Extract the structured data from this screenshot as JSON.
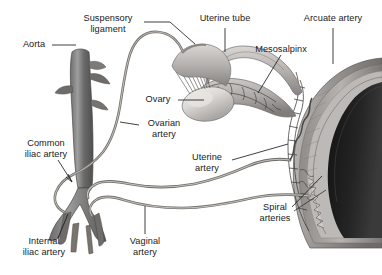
{
  "figure": {
    "style": "grayscale medical illustration",
    "colors": {
      "background": "#ffffff",
      "label_text": "#1a1a1a",
      "leader_line": "#2a2a2a",
      "vessel_dark": "#5e5e5e",
      "vessel_mid": "#8a8a8a",
      "vessel_light": "#b9b9b9",
      "ovary_pale": "#d8d5d2",
      "tissue_mid": "#a8a5a2",
      "cavity_dark": "#1c1c1c",
      "uterus_wall": "#9a9794"
    }
  },
  "labels": [
    {
      "id": "suspensory-ligament",
      "text": "Suspensory\nligament",
      "x": 108,
      "y": 17,
      "align": "center"
    },
    {
      "id": "uterine-tube",
      "text": "Uterine tube",
      "x": 225,
      "y": 17,
      "align": "center"
    },
    {
      "id": "arcuate-artery",
      "text": "Arcuate artery",
      "x": 333,
      "y": 17,
      "align": "center"
    },
    {
      "id": "aorta",
      "text": "Aorta",
      "x": 34,
      "y": 41,
      "align": "center"
    },
    {
      "id": "mesosalpinx",
      "text": "Mesosalpinx",
      "x": 285,
      "y": 48,
      "align": "center"
    },
    {
      "id": "ovary",
      "text": "Ovary",
      "x": 160,
      "y": 96,
      "align": "center"
    },
    {
      "id": "ovarian-artery",
      "text": "Ovarian\nartery",
      "x": 163,
      "y": 122,
      "align": "center"
    },
    {
      "id": "common-iliac-artery",
      "text": "Common\niliac artery",
      "x": 45,
      "y": 142,
      "align": "center"
    },
    {
      "id": "uterine-artery",
      "text": "Uterine\nartery",
      "x": 206,
      "y": 155,
      "align": "center"
    },
    {
      "id": "spiral-arteries",
      "text": "Spiral\narteries",
      "x": 275,
      "y": 205,
      "align": "center"
    },
    {
      "id": "internal-iliac-artery",
      "text": "Internal\niliac artery",
      "x": 44,
      "y": 240,
      "align": "center"
    },
    {
      "id": "vaginal-artery",
      "text": "Vaginal\nartery",
      "x": 145,
      "y": 240,
      "align": "center"
    }
  ],
  "structures": [
    {
      "id": "aorta",
      "name": "Abdominal aorta"
    },
    {
      "id": "common-iliac-artery",
      "name": "Common iliac artery"
    },
    {
      "id": "internal-iliac-artery",
      "name": "Internal iliac artery"
    },
    {
      "id": "ovarian-artery",
      "name": "Ovarian artery"
    },
    {
      "id": "uterine-artery",
      "name": "Uterine artery"
    },
    {
      "id": "vaginal-artery",
      "name": "Vaginal artery"
    },
    {
      "id": "arcuate-artery",
      "name": "Arcuate artery"
    },
    {
      "id": "spiral-arteries",
      "name": "Spiral arteries"
    },
    {
      "id": "ovary",
      "name": "Ovary"
    },
    {
      "id": "uterine-tube",
      "name": "Uterine tube"
    },
    {
      "id": "mesosalpinx",
      "name": "Mesosalpinx"
    },
    {
      "id": "suspensory-ligament",
      "name": "Suspensory ligament"
    }
  ]
}
